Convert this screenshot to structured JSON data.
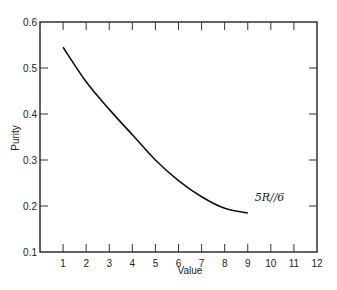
{
  "chart_data": {
    "type": "line",
    "title": "",
    "xlabel": "Value",
    "ylabel": "Purity",
    "xlim": [
      0,
      12
    ],
    "ylim": [
      0.1,
      0.6
    ],
    "x_ticks": [
      1,
      2,
      3,
      4,
      5,
      6,
      7,
      8,
      9,
      10,
      11,
      12
    ],
    "y_ticks": [
      0.1,
      0.2,
      0.3,
      0.4,
      0.5,
      0.6
    ],
    "y_tick_labels": [
      "0.1",
      "0.2",
      "0.3",
      "0.4",
      "0.5",
      "0.6"
    ],
    "grid": false,
    "legend": null,
    "series": [
      {
        "name": "5R//6",
        "x": [
          1,
          2,
          3,
          4,
          5,
          6,
          7,
          8,
          9
        ],
        "values": [
          0.545,
          0.47,
          0.41,
          0.355,
          0.3,
          0.255,
          0.22,
          0.195,
          0.185
        ]
      }
    ],
    "annotations": [
      {
        "text": "5R//6",
        "x": 9.3,
        "y": 0.21
      }
    ]
  }
}
